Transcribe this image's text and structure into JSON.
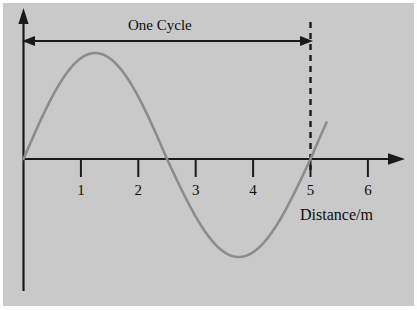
{
  "figure": {
    "background_color": "#c9c9c9",
    "curve_color": "#8c8c8c",
    "axis_color": "#1a1a1a",
    "span_label": "One Cycle",
    "x_axis_title": "Distance/m"
  },
  "chart_data": {
    "type": "line",
    "title": "",
    "subtitle": "",
    "xlabel": "Distance/m",
    "ylabel": "",
    "xlim": [
      0,
      6.55
    ],
    "ylim": [
      -1.1,
      1.1
    ],
    "grid": false,
    "legend": null,
    "x_ticks": [
      1,
      2,
      3,
      4,
      5,
      6
    ],
    "x_tick_labels": [
      "1",
      "2",
      "3",
      "4",
      "5",
      "6"
    ],
    "y_ticks": [],
    "y_tick_labels": [],
    "series": [
      {
        "name": "displacement",
        "equation": "y = A sin(2*pi*x / 5)",
        "wavelength": 5,
        "amplitude": 1,
        "x_start": 0,
        "x_end": 5.28,
        "zero_crossings": [
          0,
          2.5,
          5
        ],
        "peak": {
          "x": 1.25,
          "y": 1
        },
        "trough": {
          "x": 3.75,
          "y": -1
        },
        "x": [
          0,
          0.25,
          0.5,
          0.75,
          1,
          1.25,
          1.5,
          1.75,
          2,
          2.25,
          2.5,
          2.75,
          3,
          3.25,
          3.5,
          3.75,
          4,
          4.25,
          4.5,
          4.75,
          5,
          5.25
        ],
        "values": [
          0,
          0.309,
          0.588,
          0.809,
          0.951,
          1,
          0.951,
          0.809,
          0.588,
          0.309,
          0,
          -0.309,
          -0.588,
          -0.809,
          -0.951,
          -1,
          -0.951,
          -0.809,
          -0.588,
          -0.309,
          0,
          0.309
        ]
      }
    ],
    "annotations": [
      {
        "kind": "double-arrow-span",
        "label": "One Cycle",
        "x_from": 0,
        "x_to": 5
      },
      {
        "kind": "dashed-vertical-marker",
        "x": 5
      }
    ]
  },
  "tick_labels": {
    "t1": "1",
    "t2": "2",
    "t3": "3",
    "t4": "4",
    "t5": "5",
    "t6": "6"
  }
}
